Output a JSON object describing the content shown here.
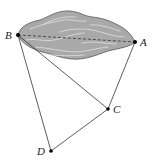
{
  "diagram": {
    "type": "geometry",
    "colors": {
      "lake_fill": "#a9a9a9",
      "lake_stroke": "#555555",
      "ripple": "#e6e6e6",
      "line": "#333333",
      "point": "#000000"
    },
    "points": [
      {
        "id": "A",
        "label": "A",
        "x": 135,
        "y": 42,
        "label_dx": 5,
        "label_dy": 4
      },
      {
        "id": "B",
        "label": "B",
        "x": 18,
        "y": 35,
        "label_dx": -14,
        "label_dy": 4
      },
      {
        "id": "C",
        "label": "C",
        "x": 108,
        "y": 109,
        "label_dx": 5,
        "label_dy": 4
      },
      {
        "id": "D",
        "label": "D",
        "x": 51,
        "y": 151,
        "label_dx": -14,
        "label_dy": 4
      }
    ],
    "segments": [
      {
        "from": "B",
        "to": "D",
        "style": "solid"
      },
      {
        "from": "B",
        "to": "C",
        "style": "solid"
      },
      {
        "from": "A",
        "to": "C",
        "style": "solid"
      },
      {
        "from": "D",
        "to": "C",
        "style": "solid"
      },
      {
        "from": "B",
        "to": "A",
        "style": "dashed"
      }
    ],
    "labels": {
      "A": "A",
      "B": "B",
      "C": "C",
      "D": "D"
    }
  }
}
